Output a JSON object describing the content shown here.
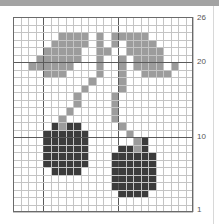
{
  "chart": {
    "columns": 24,
    "rows": 26,
    "row_labels": [
      {
        "label": "26",
        "row": 26
      },
      {
        "label": "20",
        "row": 20
      },
      {
        "label": "10",
        "row": 10
      },
      {
        "label": "1",
        "row": 1
      }
    ],
    "colors": {
      "leaf": "#9c9c9c",
      "cherry": "#3b3b3b",
      "grid": "#c4c4c4",
      "grid_heavy": "#5a5a5a",
      "background": "#ffffff"
    },
    "cells": {
      "leaf": {
        "24": [
          6,
          7,
          8,
          9,
          11,
          13,
          14,
          15,
          16,
          17
        ],
        "23": [
          5,
          6,
          7,
          8,
          9,
          11,
          13,
          15,
          16,
          17,
          18
        ],
        "22": [
          4,
          5,
          6,
          7,
          8,
          11,
          12,
          15,
          16,
          17,
          18,
          19
        ],
        "21": [
          3,
          4,
          5,
          6,
          7,
          8,
          11,
          14,
          16,
          17,
          18,
          19
        ],
        "20": [
          2,
          3,
          4,
          5,
          6,
          7,
          11,
          14,
          16,
          17,
          18,
          19,
          21
        ],
        "19": [
          4,
          5,
          6,
          11,
          14,
          17,
          18,
          19,
          20
        ],
        "18": [
          10,
          14
        ],
        "17": [
          9,
          14
        ],
        "16": [
          8,
          13
        ],
        "15": [
          8,
          13
        ],
        "14": [
          7,
          13
        ],
        "13": [
          6,
          13
        ],
        "12": [
          6,
          14
        ],
        "11": [
          15
        ],
        "10": [
          16
        ],
        "9": [
          16
        ]
      },
      "cherry": {
        "12": [
          5,
          7,
          8
        ],
        "11": [
          4,
          5,
          6,
          7,
          8,
          9
        ],
        "10": [
          4,
          5,
          6,
          7,
          8,
          9,
          17
        ],
        "9": [
          4,
          5,
          6,
          7,
          8,
          9,
          14,
          15,
          17
        ],
        "8": [
          4,
          5,
          6,
          7,
          8,
          9,
          13,
          14,
          15,
          16,
          17,
          18
        ],
        "7": [
          4,
          5,
          6,
          7,
          8,
          9,
          13,
          14,
          15,
          16,
          17,
          18
        ],
        "6": [
          5,
          6,
          7,
          8,
          13,
          14,
          15,
          16,
          17,
          18
        ],
        "5": [
          13,
          14,
          15,
          16,
          17,
          18
        ],
        "4": [
          13,
          14,
          15,
          16,
          17,
          18
        ],
        "3": [
          14,
          15,
          16,
          17
        ]
      }
    }
  }
}
